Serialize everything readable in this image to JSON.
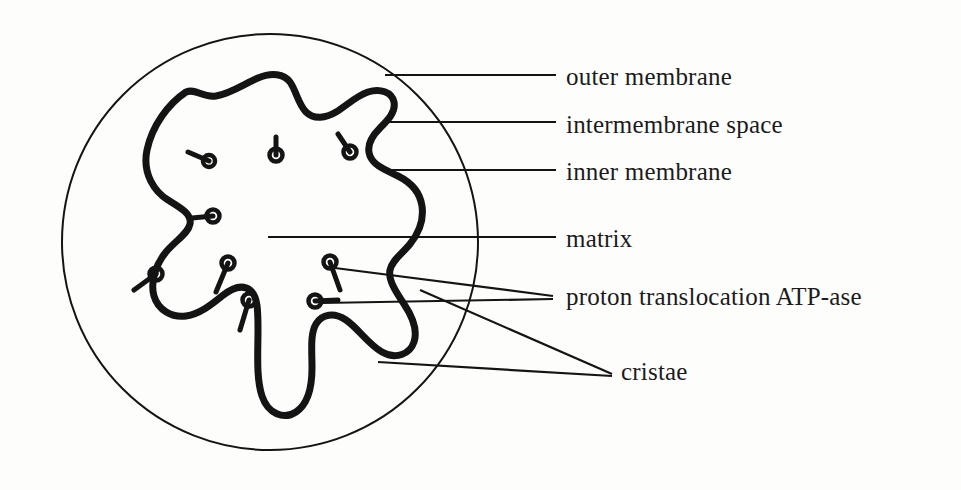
{
  "figure": {
    "ink_color": "#141414",
    "background_color": "#fdfdfc",
    "outer_membrane_stroke_width": 2,
    "inner_membrane_stroke_width": 7,
    "leader_line_stroke_width": 2.2
  },
  "labels": [
    {
      "id": "outer-membrane",
      "text": "outer membrane",
      "x": 566,
      "y": 83
    },
    {
      "id": "intermembrane-space",
      "text": "intermembrane space",
      "x": 566,
      "y": 131
    },
    {
      "id": "inner-membrane",
      "text": "inner membrane",
      "x": 566,
      "y": 178
    },
    {
      "id": "matrix",
      "text": "matrix",
      "x": 566,
      "y": 245
    },
    {
      "id": "atp-ase",
      "text": "proton translocation ATP-ase",
      "x": 566,
      "y": 303
    },
    {
      "id": "cristae",
      "text": "cristae",
      "x": 621,
      "y": 378
    }
  ],
  "outer_membrane": {
    "shape": "circle",
    "cx": 270,
    "cy": 242,
    "r": 208
  },
  "inner_membrane": {
    "shape": "closed-wavy-cristae-path",
    "path": "M 186 92 C 168 104 152 126 147 150 C 142 174 155 192 168 200 C 181 208 192 214 190 224 C 188 234 176 240 166 252 C 156 264 150 282 154 296 C 158 310 172 318 186 316 C 200 314 212 304 222 296 C 232 288 242 284 250 290 C 258 296 258 312 258 330 C 258 352 256 378 262 396 C 268 414 284 420 296 412 C 308 404 312 386 312 368 C 312 350 310 334 316 324 C 322 314 334 312 346 320 C 358 328 368 344 382 352 C 396 360 410 354 414 342 C 418 330 412 316 404 304 C 396 292 388 280 390 270 C 392 260 402 254 410 244 C 418 234 424 220 422 206 C 420 192 410 182 398 176 C 386 170 374 166 370 156 C 366 146 372 136 380 128 C 388 120 396 112 394 102 C 392 92 380 88 368 92 C 356 96 346 106 336 112 C 326 118 314 120 306 112 C 298 104 296 90 290 82 C 284 74 272 72 258 78 C 244 84 230 94 216 96 C 202 98 196 88 186 92 Z"
  },
  "atp_particles": [
    {
      "head_x": 209,
      "head_y": 161,
      "stalk_x": 188,
      "stalk_y": 152,
      "r": 6
    },
    {
      "head_x": 276,
      "head_y": 155,
      "stalk_x": 276,
      "stalk_y": 137,
      "r": 6.5
    },
    {
      "head_x": 350,
      "head_y": 152,
      "stalk_x": 338,
      "stalk_y": 134,
      "r": 6.5
    },
    {
      "head_x": 213,
      "head_y": 216,
      "stalk_x": 192,
      "stalk_y": 218,
      "r": 6.5
    },
    {
      "head_x": 156,
      "head_y": 274,
      "stalk_x": 134,
      "stalk_y": 290,
      "r": 6.5
    },
    {
      "head_x": 228,
      "head_y": 263,
      "stalk_x": 216,
      "stalk_y": 292,
      "r": 6.5
    },
    {
      "head_x": 249,
      "head_y": 300,
      "stalk_x": 240,
      "stalk_y": 330,
      "r": 6.5
    },
    {
      "head_x": 330,
      "head_y": 262,
      "stalk_x": 340,
      "stalk_y": 290,
      "r": 6.5
    },
    {
      "head_x": 315,
      "head_y": 301,
      "stalk_x": 338,
      "stalk_y": 300,
      "r": 6.5
    }
  ],
  "leader_lines": [
    {
      "id": "outer-membrane-leader",
      "x1": 385,
      "y1": 75,
      "x2": 556,
      "y2": 75
    },
    {
      "id": "intermembrane-space-leader",
      "x1": 387,
      "y1": 122,
      "x2": 556,
      "y2": 122
    },
    {
      "id": "inner-membrane-leader",
      "x1": 385,
      "y1": 170,
      "x2": 556,
      "y2": 170
    },
    {
      "id": "matrix-leader",
      "x1": 268,
      "y1": 237,
      "x2": 556,
      "y2": 237
    },
    {
      "id": "atp-ase-leader-upper",
      "x1": 335,
      "y1": 268,
      "x2": 553,
      "y2": 296
    },
    {
      "id": "atp-ase-leader-lower",
      "x1": 322,
      "y1": 303,
      "x2": 553,
      "y2": 299
    },
    {
      "id": "cristae-leader-upper",
      "x1": 420,
      "y1": 290,
      "x2": 612,
      "y2": 374
    },
    {
      "id": "cristae-leader-lower",
      "x1": 378,
      "y1": 362,
      "x2": 612,
      "y2": 376
    }
  ]
}
